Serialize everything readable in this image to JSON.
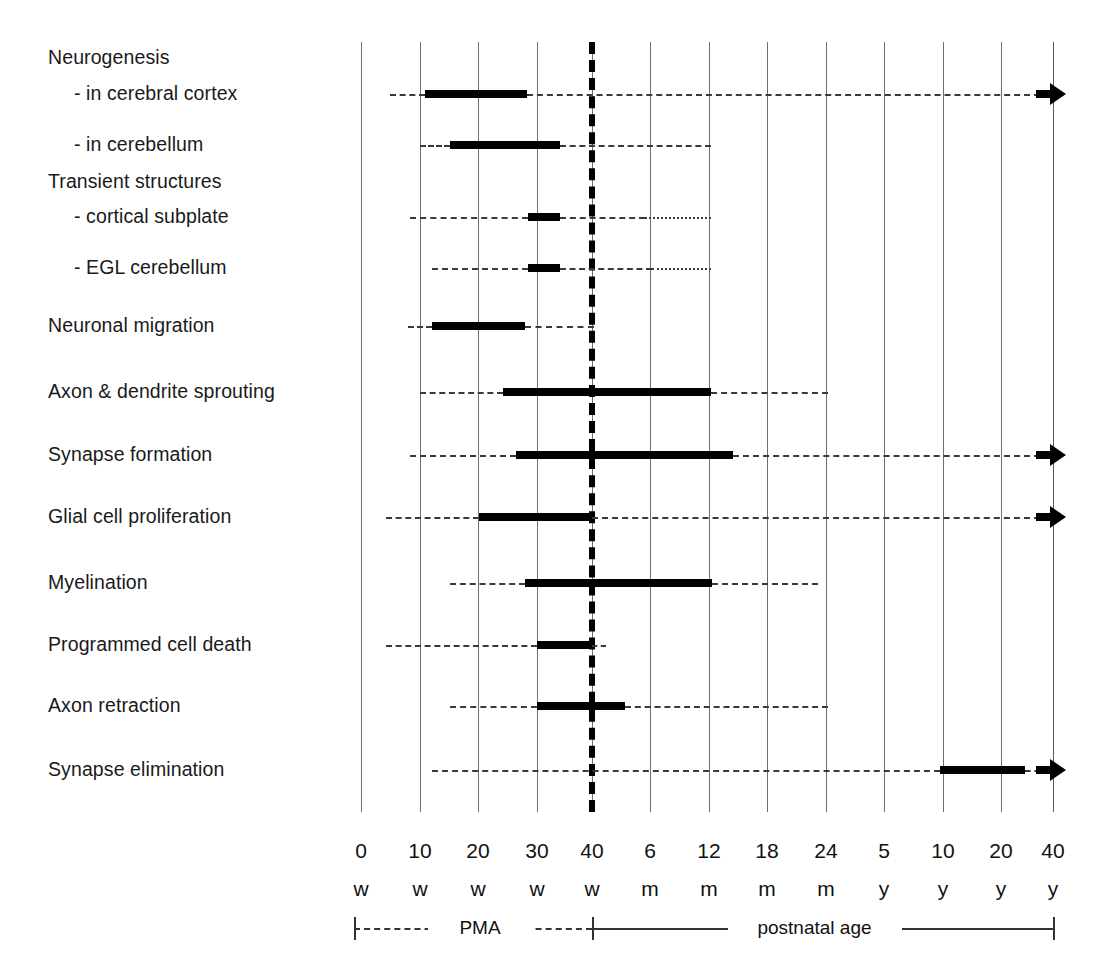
{
  "chart_data": {
    "type": "table",
    "title": "",
    "xlabel": "",
    "ylabel": "",
    "grid": true,
    "legend_position": "bottom",
    "axis": {
      "tick_numbers": [
        "0",
        "10",
        "20",
        "30",
        "40",
        "6",
        "12",
        "18",
        "24",
        "5",
        "10",
        "20",
        "40"
      ],
      "tick_units": [
        "w",
        "w",
        "w",
        "w",
        "w",
        "m",
        "m",
        "m",
        "m",
        "y",
        "y",
        "y",
        "y"
      ],
      "tick_x": [
        361,
        420,
        478,
        537,
        592,
        650,
        709,
        767,
        826,
        884,
        943,
        1001,
        1053
      ],
      "pma_marker_x": 592,
      "pma_marker_label": "40 w"
    },
    "phase_legend": {
      "prenatal_label": "PMA",
      "postnatal_label": "postnatal age",
      "prenatal_span_x": [
        354,
        592
      ],
      "postnatal_span_x": [
        592,
        1053
      ]
    },
    "rows": [
      {
        "label": "Neurogenesis",
        "indent": false,
        "header_only": true,
        "y": 58,
        "segments": [],
        "arrow": false
      },
      {
        "label": "-  in cerebral cortex",
        "indent": true,
        "header_only": false,
        "y": 94,
        "segments": [
          {
            "style": "dash",
            "x0": 390,
            "x1": 425
          },
          {
            "style": "solid",
            "x0": 425,
            "x1": 527
          },
          {
            "style": "dash",
            "x0": 527,
            "x1": 1040
          }
        ],
        "arrow": true
      },
      {
        "label": "-  in cerebellum",
        "indent": true,
        "header_only": false,
        "y": 145,
        "segments": [
          {
            "style": "dash",
            "x0": 420,
            "x1": 450
          },
          {
            "style": "solid",
            "x0": 450,
            "x1": 560
          },
          {
            "style": "dash",
            "x0": 560,
            "x1": 711
          }
        ],
        "arrow": false
      },
      {
        "label": "Transient structures",
        "indent": false,
        "header_only": true,
        "y": 182,
        "segments": [],
        "arrow": false
      },
      {
        "label": "-  cortical subplate",
        "indent": true,
        "header_only": false,
        "y": 217,
        "segments": [
          {
            "style": "dash",
            "x0": 410,
            "x1": 528
          },
          {
            "style": "solid",
            "x0": 528,
            "x1": 560
          },
          {
            "style": "dash",
            "x0": 560,
            "x1": 645
          },
          {
            "style": "dot",
            "x0": 645,
            "x1": 711
          }
        ],
        "arrow": false
      },
      {
        "label": "-  EGL cerebellum",
        "indent": true,
        "header_only": false,
        "y": 268,
        "segments": [
          {
            "style": "dash",
            "x0": 432,
            "x1": 528
          },
          {
            "style": "solid",
            "x0": 528,
            "x1": 560
          },
          {
            "style": "dash",
            "x0": 560,
            "x1": 652
          },
          {
            "style": "dot",
            "x0": 652,
            "x1": 711
          }
        ],
        "arrow": false
      },
      {
        "label": "Neuronal migration",
        "indent": false,
        "header_only": false,
        "y": 326,
        "segments": [
          {
            "style": "dash",
            "x0": 408,
            "x1": 432
          },
          {
            "style": "solid",
            "x0": 432,
            "x1": 525
          },
          {
            "style": "dash",
            "x0": 525,
            "x1": 594
          }
        ],
        "arrow": false
      },
      {
        "label": "Axon & dendrite sprouting",
        "indent": false,
        "header_only": false,
        "y": 392,
        "segments": [
          {
            "style": "dash",
            "x0": 420,
            "x1": 503
          },
          {
            "style": "solid",
            "x0": 503,
            "x1": 711
          },
          {
            "style": "dash",
            "x0": 711,
            "x1": 828
          }
        ],
        "arrow": false
      },
      {
        "label": "Synapse formation",
        "indent": false,
        "header_only": false,
        "y": 455,
        "segments": [
          {
            "style": "dash",
            "x0": 410,
            "x1": 516
          },
          {
            "style": "solid",
            "x0": 516,
            "x1": 733
          },
          {
            "style": "dash",
            "x0": 733,
            "x1": 1040
          }
        ],
        "arrow": true
      },
      {
        "label": "Glial cell proliferation",
        "indent": false,
        "header_only": false,
        "y": 517,
        "segments": [
          {
            "style": "dash",
            "x0": 386,
            "x1": 479
          },
          {
            "style": "solid",
            "x0": 479,
            "x1": 592
          },
          {
            "style": "dash",
            "x0": 592,
            "x1": 1040
          }
        ],
        "arrow": true
      },
      {
        "label": "Myelination",
        "indent": false,
        "header_only": false,
        "y": 583,
        "segments": [
          {
            "style": "dash",
            "x0": 450,
            "x1": 525
          },
          {
            "style": "solid",
            "x0": 525,
            "x1": 712
          },
          {
            "style": "dash",
            "x0": 712,
            "x1": 818
          }
        ],
        "arrow": false
      },
      {
        "label": "Programmed cell death",
        "indent": false,
        "header_only": false,
        "y": 645,
        "segments": [
          {
            "style": "dash",
            "x0": 386,
            "x1": 537
          },
          {
            "style": "solid",
            "x0": 537,
            "x1": 592
          },
          {
            "style": "dash",
            "x0": 592,
            "x1": 606
          }
        ],
        "arrow": false
      },
      {
        "label": "Axon retraction",
        "indent": false,
        "header_only": false,
        "y": 706,
        "segments": [
          {
            "style": "dash",
            "x0": 450,
            "x1": 537
          },
          {
            "style": "solid",
            "x0": 537,
            "x1": 625
          },
          {
            "style": "dash",
            "x0": 625,
            "x1": 828
          }
        ],
        "arrow": false
      },
      {
        "label": "Synapse elimination",
        "indent": false,
        "header_only": false,
        "y": 770,
        "segments": [
          {
            "style": "dash",
            "x0": 432,
            "x1": 940
          },
          {
            "style": "solid",
            "x0": 940,
            "x1": 1025
          },
          {
            "style": "dash",
            "x0": 1025,
            "x1": 1040
          }
        ],
        "arrow": true
      }
    ],
    "grid_top": 42,
    "grid_bottom": 812,
    "arrow_tip_x": 1066
  }
}
